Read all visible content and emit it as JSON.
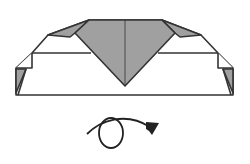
{
  "diagram": {
    "colors": {
      "line": "#333333",
      "fill_gray": "#a0a0a0",
      "paper": "#ffffff"
    },
    "model": {
      "outline": "16,95 233,95 233,68 218,53 201,35 162,20 89,20 48,35 32,53 16,68",
      "horizontal_crease_left": "32,53 91,53",
      "horizontal_crease_right": "158,53 218,53",
      "center_line": "125,20 125,86",
      "gray_v": "89,20 162,20 175,33 125,86 75,33",
      "left_top_flap": "48,35 89,20 75,33 70,37",
      "right_top_flap": "201,35 162,20 175,33 180,37",
      "left_side_notch": "16,68 32,68 32,53 16,68",
      "left_side_flap": "16,70 25,70 16,93",
      "right_side_notch": "233,68 218,68 218,53 233,68",
      "right_side_flap": "233,70 224,70 233,93"
    },
    "symbol": {
      "name": "turn-over-arrow",
      "meaning": "Turn over"
    }
  }
}
